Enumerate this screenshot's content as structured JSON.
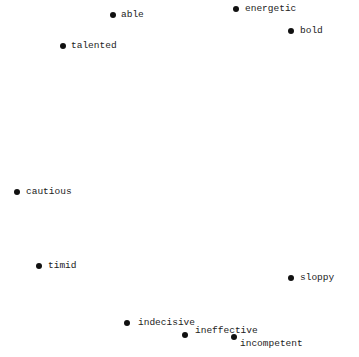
{
  "chart_data": {
    "type": "scatter",
    "title": "",
    "xlabel": "",
    "ylabel": "",
    "grid": false,
    "legend": null,
    "points": [
      {
        "label": "able",
        "x": 113,
        "y": 15,
        "lx": 121,
        "ly": 10
      },
      {
        "label": "energetic",
        "x": 236,
        "y": 9,
        "lx": 245,
        "ly": 4
      },
      {
        "label": "bold",
        "x": 291,
        "y": 31,
        "lx": 300,
        "ly": 26
      },
      {
        "label": "talented",
        "x": 63,
        "y": 46,
        "lx": 71,
        "ly": 41
      },
      {
        "label": "cautious",
        "x": 17,
        "y": 192,
        "lx": 26,
        "ly": 187
      },
      {
        "label": "timid",
        "x": 39,
        "y": 266,
        "lx": 48,
        "ly": 261
      },
      {
        "label": "sloppy",
        "x": 291,
        "y": 278,
        "lx": 300,
        "ly": 273
      },
      {
        "label": "indecisive",
        "x": 127,
        "y": 323,
        "lx": 138,
        "ly": 318
      },
      {
        "label": "ineffective",
        "x": 185,
        "y": 335,
        "lx": 195,
        "ly": 326
      },
      {
        "label": "incompetent",
        "x": 234,
        "y": 337,
        "lx": 240,
        "ly": 339
      }
    ]
  }
}
